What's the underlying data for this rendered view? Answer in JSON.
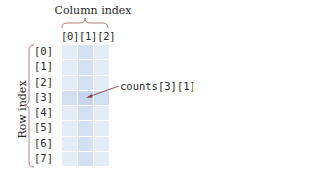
{
  "diagram": {
    "column_axis": {
      "title": "Column index",
      "labels": [
        "[0]",
        "[1]",
        "[2]"
      ],
      "label_text": "[0][1][2]"
    },
    "row_axis": {
      "title": "Row index",
      "labels": [
        "[0]",
        "[1]",
        "[2]",
        "[3]",
        "[4]",
        "[5]",
        "[6]",
        "[7]"
      ]
    },
    "grid": {
      "rows": 8,
      "cols": 3,
      "highlight_row": 3,
      "highlight_col": 1
    },
    "callout": {
      "text": "counts[3][1]",
      "target_row": 3,
      "target_col": 1
    },
    "colors": {
      "cell": "#e4ecf8",
      "cell_highlight": "#d3e0f3",
      "cell_target": "#c6d6ef",
      "brace": "#b08080",
      "arrow": "#8a4040"
    }
  }
}
